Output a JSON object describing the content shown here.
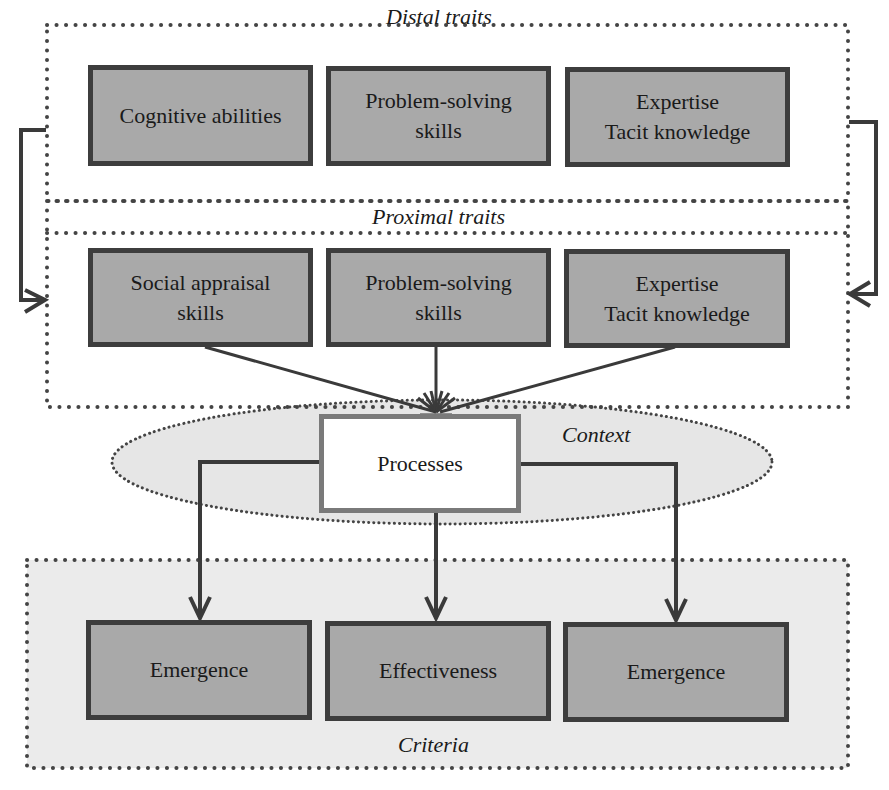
{
  "diagram": {
    "groups": {
      "distal": {
        "label": "Distal traits"
      },
      "proximal": {
        "label": "Proximal traits"
      },
      "context": {
        "label": "Context"
      },
      "criteria": {
        "label": "Criteria"
      }
    },
    "distal_nodes": [
      {
        "label": "Cognitive abilities"
      },
      {
        "label": "Problem-solving\nskills"
      },
      {
        "label": "Expertise\nTacit knowledge"
      }
    ],
    "proximal_nodes": [
      {
        "label": "Social appraisal\nskills"
      },
      {
        "label": "Problem-solving\nskills"
      },
      {
        "label": "Expertise\nTacit knowledge"
      }
    ],
    "process_node": {
      "label": "Processes"
    },
    "criteria_nodes": [
      {
        "label": "Emergence"
      },
      {
        "label": "Effectiveness"
      },
      {
        "label": "Emergence"
      }
    ],
    "edges": [
      {
        "from": "distal",
        "to": "proximal",
        "side": "left"
      },
      {
        "from": "distal",
        "to": "proximal",
        "side": "right"
      },
      {
        "from": "Social appraisal skills",
        "to": "Processes"
      },
      {
        "from": "Problem-solving skills (proximal)",
        "to": "Processes"
      },
      {
        "from": "Expertise / Tacit knowledge (proximal)",
        "to": "Processes"
      },
      {
        "from": "Processes",
        "to": "Emergence (left)"
      },
      {
        "from": "Processes",
        "to": "Effectiveness"
      },
      {
        "from": "Processes",
        "to": "Emergence (right)"
      }
    ],
    "colors": {
      "node_fill": "#a9a9a9",
      "node_border": "#3d3d3d",
      "context_fill": "#e6e6e6",
      "criteria_fill": "#ebebeb",
      "process_border": "#7a7a7a",
      "line": "#3a3a3a",
      "dots": "#444444"
    }
  }
}
